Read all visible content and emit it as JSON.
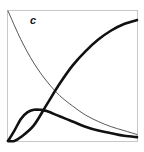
{
  "panel": {
    "label": "c"
  },
  "chart_data": {
    "type": "line",
    "title": "",
    "panel_label": "c",
    "xlabel": "",
    "ylabel": "",
    "xlim": [
      0,
      1
    ],
    "ylim": [
      0,
      1
    ],
    "grid": false,
    "legend": null,
    "series": [
      {
        "name": "thin decreasing curve",
        "style": "thin",
        "x": [
          0.0,
          0.1,
          0.2,
          0.3,
          0.4,
          0.5,
          0.6,
          0.7,
          0.8,
          0.9,
          1.0
        ],
        "y": [
          1.0,
          0.78,
          0.6,
          0.46,
          0.35,
          0.27,
          0.2,
          0.15,
          0.11,
          0.08,
          0.05
        ]
      },
      {
        "name": "thick sigmoid rising curve",
        "style": "thick",
        "x": [
          0.0,
          0.05,
          0.1,
          0.2,
          0.3,
          0.4,
          0.5,
          0.6,
          0.7,
          0.8,
          0.9,
          1.0
        ],
        "y": [
          0.0,
          0.0,
          0.03,
          0.12,
          0.28,
          0.44,
          0.58,
          0.69,
          0.78,
          0.85,
          0.9,
          0.93
        ]
      },
      {
        "name": "thick hump curve",
        "style": "thick",
        "x": [
          0.0,
          0.05,
          0.1,
          0.15,
          0.2,
          0.25,
          0.3,
          0.4,
          0.5,
          0.6,
          0.7,
          0.8,
          0.9,
          1.0
        ],
        "y": [
          0.0,
          0.08,
          0.17,
          0.22,
          0.24,
          0.24,
          0.23,
          0.19,
          0.15,
          0.11,
          0.08,
          0.06,
          0.04,
          0.03
        ]
      }
    ]
  }
}
